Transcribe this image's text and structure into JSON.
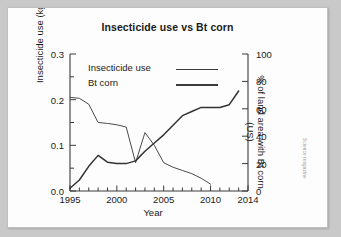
{
  "figure": {
    "title": "Insecticide use vs Bt corn",
    "credit": "Science magazine"
  },
  "legend": {
    "position": "top-left-inside",
    "items": [
      {
        "label": "Insecticide use",
        "weight": "thin"
      },
      {
        "label": "Bt corn",
        "weight": "thick"
      }
    ]
  },
  "axes": {
    "x": {
      "label": "Year",
      "min": 1995,
      "max": 2014,
      "ticks": [
        1995,
        2000,
        2005,
        2010,
        2014
      ],
      "tick_labels": [
        "1995",
        "2000",
        "2005",
        "2010",
        "2014"
      ],
      "minor_tick_step": 1
    },
    "y_left": {
      "label": "Insecticide use (kg/ha)",
      "min": 0.0,
      "max": 0.3,
      "ticks": [
        0.0,
        0.1,
        0.2,
        0.3
      ],
      "tick_labels": [
        "0.0",
        "0.1",
        "0.2",
        "0.3"
      ],
      "minor_ticks": [
        0.05,
        0.15,
        0.25
      ]
    },
    "y_right": {
      "label": "% of land area with Bt corn (US)",
      "min": 0,
      "max": 100,
      "ticks": [
        0,
        20,
        40,
        60,
        80,
        100
      ],
      "tick_labels": [
        "0",
        "20",
        "40",
        "60",
        "80",
        "100"
      ]
    }
  },
  "chart_data": {
    "type": "line",
    "title": "Insecticide use vs Bt corn",
    "xlabel": "Year",
    "ylabel": "Insecticide use (kg/ha)",
    "ylabel_secondary": "% of land area with Bt corn (US)",
    "xlim": [
      1995,
      2014
    ],
    "ylim": [
      0.0,
      0.3
    ],
    "ylim_secondary": [
      0,
      100
    ],
    "grid": false,
    "legend_position": "upper left",
    "series": [
      {
        "name": "Insecticide use",
        "axis": "left",
        "units": "kg/ha",
        "x": [
          1995,
          1996,
          1997,
          1998,
          1999,
          2000,
          2001,
          2002,
          2003,
          2004,
          2005,
          2006,
          2007,
          2008,
          2009,
          2010
        ],
        "values": [
          0.205,
          0.203,
          0.19,
          0.15,
          0.148,
          0.145,
          0.14,
          0.062,
          0.128,
          0.1,
          0.062,
          0.052,
          0.045,
          0.038,
          0.028,
          0.015
        ]
      },
      {
        "name": "Bt corn",
        "axis": "right",
        "units": "% of land area (US)",
        "x": [
          1995,
          1996,
          1997,
          1998,
          1999,
          2000,
          2001,
          2002,
          2003,
          2004,
          2005,
          2006,
          2007,
          2008,
          2009,
          2010,
          2011,
          2012,
          2013
        ],
        "values": [
          2,
          8,
          18,
          26,
          21,
          20,
          20,
          22,
          29,
          35,
          41,
          48,
          55,
          58,
          61,
          61,
          61,
          63,
          73
        ]
      }
    ]
  }
}
